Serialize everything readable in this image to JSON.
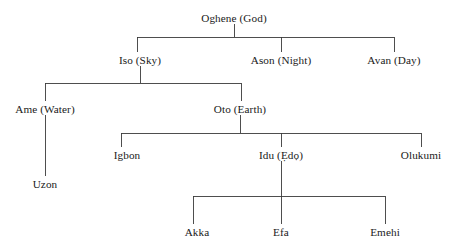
{
  "diagram": {
    "type": "hierarchy-tree",
    "line_color": "#3b3b3b",
    "text_color": "#1a1a1a",
    "background_color": "#ffffff",
    "nodes": [
      {
        "id": "oghene",
        "label": "Oghene (God)",
        "level": 0,
        "x": 234,
        "y": 19
      },
      {
        "id": "iso",
        "label": "Iso (Sky)",
        "level": 1,
        "x": 140,
        "y": 61
      },
      {
        "id": "ason",
        "label": "Ason (Night)",
        "level": 1,
        "x": 281,
        "y": 61
      },
      {
        "id": "avan",
        "label": "Avan (Day)",
        "level": 1,
        "x": 394,
        "y": 61
      },
      {
        "id": "ame",
        "label": "Ame (Water)",
        "level": 2,
        "x": 45,
        "y": 110
      },
      {
        "id": "oto",
        "label": "Oto (Earth)",
        "level": 2,
        "x": 240,
        "y": 110
      },
      {
        "id": "uzon",
        "label": "Uzon",
        "level": 3,
        "x": 45,
        "y": 185
      },
      {
        "id": "igbon",
        "label": "Igbon",
        "level": 3,
        "x": 127,
        "y": 156
      },
      {
        "id": "idu",
        "label": "Idu (Ẹdọ)",
        "level": 3,
        "x": 281,
        "y": 156
      },
      {
        "id": "olukumi",
        "label": "Olukumi",
        "level": 3,
        "x": 421,
        "y": 156
      },
      {
        "id": "akka",
        "label": "Akka",
        "level": 4,
        "x": 197,
        "y": 233
      },
      {
        "id": "efa",
        "label": "Efa",
        "level": 4,
        "x": 281,
        "y": 233
      },
      {
        "id": "emehi",
        "label": "Emehi",
        "level": 4,
        "x": 385,
        "y": 233
      }
    ],
    "edges": [
      {
        "from": "oghene",
        "to": "iso"
      },
      {
        "from": "oghene",
        "to": "ason"
      },
      {
        "from": "oghene",
        "to": "avan"
      },
      {
        "from": "iso",
        "to": "ame"
      },
      {
        "from": "iso",
        "to": "oto"
      },
      {
        "from": "ame",
        "to": "uzon"
      },
      {
        "from": "oto",
        "to": "igbon"
      },
      {
        "from": "oto",
        "to": "idu"
      },
      {
        "from": "oto",
        "to": "olukumi"
      },
      {
        "from": "idu",
        "to": "akka"
      },
      {
        "from": "idu",
        "to": "efa"
      },
      {
        "from": "idu",
        "to": "emehi"
      }
    ],
    "connectors": [
      {
        "id": "conn-oghene",
        "parent_x": 234,
        "stem_top": 24,
        "bar_y": 37,
        "bar_x1": 137,
        "bar_x2": 394,
        "drops": [
          137,
          281,
          394
        ],
        "drop_bottom": 52
      },
      {
        "id": "conn-iso",
        "parent_x": 140,
        "stem_top": 66,
        "bar_y": 83,
        "bar_x1": 45,
        "bar_x2": 241,
        "drops": [
          45,
          241
        ],
        "drop_bottom": 101
      },
      {
        "id": "conn-ame",
        "parent_x": 45,
        "stem_top": 115,
        "bar_y": 115,
        "bar_x1": 45,
        "bar_x2": 45,
        "drops": [
          45
        ],
        "drop_bottom": 176
      },
      {
        "id": "conn-oto",
        "parent_x": 240,
        "stem_top": 115,
        "bar_y": 133,
        "bar_x1": 121,
        "bar_x2": 421,
        "drops": [
          121,
          281,
          421
        ],
        "drop_bottom": 147
      },
      {
        "id": "conn-idu",
        "parent_x": 281,
        "stem_top": 161,
        "bar_y": 196,
        "bar_x1": 193,
        "bar_x2": 385,
        "drops": [
          193,
          281,
          385
        ],
        "drop_bottom": 224
      }
    ]
  }
}
